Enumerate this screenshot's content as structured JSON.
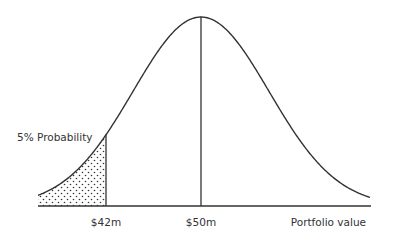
{
  "chart_data": {
    "type": "area",
    "title": "",
    "distribution": "normal",
    "xlabel": "Portfolio value",
    "ylabel": "",
    "x_ticks": [
      "$42m",
      "$50m"
    ],
    "mean_label": "$50m",
    "var_cutoff_label": "$42m",
    "shaded_region": {
      "from": "left tail",
      "to": "$42m",
      "fill": "dotted",
      "label": "5% Probability"
    },
    "annotations": [
      "5% Probability"
    ],
    "grid": false,
    "legend": "none"
  },
  "labels": {
    "tail_probability": "5% Probability",
    "cutoff": "$42m",
    "mean": "$50m",
    "axis": "Portfolio value"
  },
  "style": {
    "line_color": "#333333",
    "background": "#ffffff"
  }
}
